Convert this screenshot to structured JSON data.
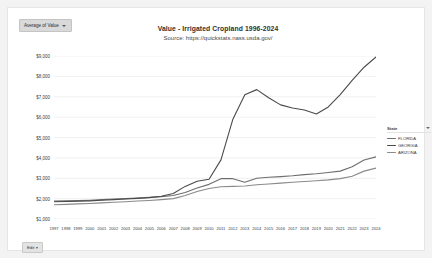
{
  "pill": {
    "label": "Average of Value",
    "icon": "chevron-down-icon"
  },
  "header": {
    "title": "Value - Irrigated Cropland  1996-2024",
    "source": "Source: https://quickstats.nass.usda.gov/"
  },
  "legend": {
    "header_label": "State",
    "filter_icon": "filter-icon",
    "items": [
      {
        "label": "FLORIDA",
        "color": "#6e6e6e"
      },
      {
        "label": "GEORGIA",
        "color": "#4a4a4a"
      },
      {
        "label": "ARIZONA",
        "color": "#8a8a8a"
      }
    ]
  },
  "footer": {
    "edit_label": "Edit",
    "icon": "chevron-down-icon"
  },
  "chart_data": {
    "type": "line",
    "title": "Value - Irrigated Cropland  1996-2024",
    "subtitle": "Source: https://quickstats.nass.usda.gov/",
    "xlabel": "",
    "ylabel": "",
    "ylim": [
      1000,
      9000
    ],
    "yticks": [
      9000,
      8000,
      7000,
      6000,
      5000,
      4000,
      3000,
      2000,
      1000
    ],
    "ytick_labels": [
      "$9,000",
      "$8,000",
      "$7,000",
      "$6,000",
      "$5,000",
      "$4,000",
      "$3,000",
      "$2,000",
      "$1,000"
    ],
    "grid": true,
    "legend_position": "right",
    "x": [
      1997,
      1998,
      1999,
      2000,
      2001,
      2002,
      2003,
      2004,
      2005,
      2006,
      2007,
      2008,
      2009,
      2010,
      2011,
      2012,
      2013,
      2014,
      2015,
      2016,
      2017,
      2018,
      2019,
      2020,
      2021,
      2022,
      2023,
      2024
    ],
    "categories": [
      "1997",
      "1998",
      "1999",
      "2000",
      "2001",
      "2002",
      "2003",
      "2004",
      "2005",
      "2006",
      "2007",
      "2008",
      "2009",
      "2010",
      "2011",
      "2012",
      "2013",
      "2014",
      "2015",
      "2016",
      "2017",
      "2018",
      "2019",
      "2020",
      "2021",
      "2022",
      "2023",
      "2024"
    ],
    "series": [
      {
        "name": "FLORIDA",
        "color": "#6e6e6e",
        "values": [
          1880,
          1890,
          1900,
          1920,
          1950,
          1980,
          2000,
          2030,
          2060,
          2100,
          2150,
          2300,
          2520,
          2700,
          2980,
          2980,
          2800,
          3000,
          3050,
          3080,
          3120,
          3180,
          3220,
          3280,
          3350,
          3560,
          3900,
          4050
        ]
      },
      {
        "name": "GEORGIA",
        "color": "#4a4a4a",
        "values": [
          1850,
          1860,
          1870,
          1890,
          1920,
          1950,
          1980,
          2010,
          2050,
          2120,
          2250,
          2600,
          2850,
          2950,
          3900,
          5900,
          7100,
          7350,
          6950,
          6600,
          6450,
          6350,
          6150,
          6500,
          7100,
          7800,
          8450,
          8950
        ]
      },
      {
        "name": "ARIZONA",
        "color": "#8a8a8a",
        "values": [
          1700,
          1720,
          1740,
          1760,
          1790,
          1820,
          1850,
          1880,
          1910,
          1950,
          2000,
          2150,
          2350,
          2500,
          2580,
          2600,
          2620,
          2680,
          2720,
          2760,
          2800,
          2840,
          2880,
          2920,
          2980,
          3100,
          3350,
          3500
        ]
      }
    ]
  }
}
